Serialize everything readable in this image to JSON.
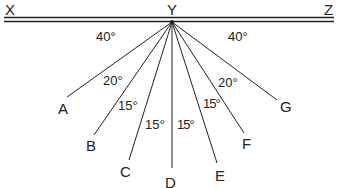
{
  "diagram": {
    "points": {
      "X": "X",
      "Y": "Y",
      "Z": "Z",
      "A": "A",
      "B": "B",
      "C": "C",
      "D": "D",
      "E": "E",
      "F": "F",
      "G": "G"
    },
    "angles": {
      "XYA": "40°",
      "AYB": "20°",
      "BYC": "15°",
      "CYD": "15°",
      "DYE": "15°",
      "EYF": "15°",
      "FYG": "20°",
      "GYZ": "40°"
    }
  }
}
